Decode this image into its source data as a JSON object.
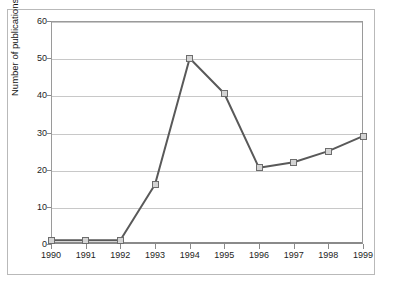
{
  "chart_data": {
    "type": "line",
    "title": "",
    "xlabel": "",
    "ylabel": "Number of publications",
    "categories": [
      "1990",
      "1991",
      "1992",
      "1993",
      "1994",
      "1995",
      "1996",
      "1997",
      "1998",
      "1999"
    ],
    "values": [
      1,
      1,
      1,
      16,
      50,
      40.5,
      20.5,
      22,
      25,
      29
    ],
    "series": [
      {
        "name": "Number of publications",
        "values": [
          1,
          1,
          1,
          16,
          50,
          40.5,
          20.5,
          22,
          25,
          29
        ]
      }
    ],
    "ylim": [
      0,
      60
    ],
    "yticks": [
      0,
      10,
      20,
      30,
      40,
      50,
      60
    ],
    "ytick_labels": [
      "0",
      "10",
      "20",
      "30",
      "40",
      "50",
      "60"
    ],
    "xtick_labels": [
      "1990",
      "1991",
      "1992",
      "1993",
      "1994",
      "1995",
      "1996",
      "1997",
      "1998",
      "1999"
    ],
    "grid": "horizontal",
    "legend": "none",
    "line_color": "#595959",
    "marker_fill": "#d4d4d4",
    "marker_edge": "#6d6d6d",
    "gridline_color": "#c8c8c8",
    "axis_color": "#8a8a8a",
    "background": "#ffffff",
    "marker_shape": "square"
  }
}
